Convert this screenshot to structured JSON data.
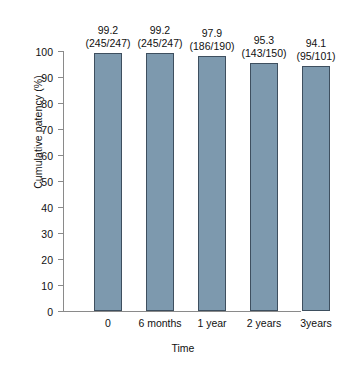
{
  "chart_data": {
    "type": "bar",
    "title": "",
    "xlabel": "Time",
    "ylabel": "Cumulative patency (%)",
    "categories": [
      "0",
      "6 months",
      "1 year",
      "2 years",
      "3years"
    ],
    "values": [
      99.2,
      99.2,
      97.9,
      95.3,
      94.1
    ],
    "value_labels": [
      "99.2",
      "99.2",
      "97.9",
      "95.3",
      "94.1"
    ],
    "fraction_labels": [
      "(245/247)",
      "(245/247)",
      "(186/190)",
      "(143/150)",
      "(95/101)"
    ],
    "numerators": [
      245,
      245,
      186,
      143,
      95
    ],
    "denominators": [
      247,
      247,
      190,
      150,
      101
    ],
    "ylim": [
      0,
      100
    ],
    "ytick_labels": [
      "100",
      "90",
      "80",
      "70",
      "60",
      "50",
      "40",
      "30",
      "20",
      "10",
      "0"
    ],
    "ytick_values": [
      100,
      90,
      80,
      70,
      60,
      50,
      40,
      30,
      20,
      10,
      0
    ],
    "grid": false,
    "legend": false,
    "bar_color": "#7d99ae",
    "bar_edge_color": "#3e4f5f",
    "axis_color": "#8a8a8a"
  }
}
